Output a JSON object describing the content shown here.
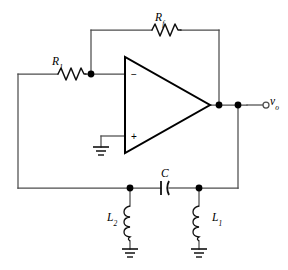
{
  "figure": {
    "name": "op-amp-colpitts-oscillator-circuit",
    "background_color": "#ffffff",
    "wire_color": "#4d4d4d",
    "component_color": "#111111",
    "node_color": "#000000"
  },
  "labels": {
    "rf": "R",
    "rf_sub": "f",
    "r1": "R",
    "r1_sub": "1",
    "c": "C",
    "l2": "L",
    "l2_sub": "2",
    "l1": "L",
    "l1_sub": "1",
    "vo": "v",
    "vo_sub": "o"
  },
  "opamp": {
    "inverting_sign": "−",
    "noninverting_sign": "+"
  },
  "components": [
    {
      "id": "rf",
      "type": "resistor",
      "label": "Rf",
      "orientation": "horizontal"
    },
    {
      "id": "r1",
      "type": "resistor",
      "label": "R1",
      "orientation": "horizontal"
    },
    {
      "id": "c",
      "type": "capacitor",
      "label": "C",
      "orientation": "horizontal"
    },
    {
      "id": "l1",
      "type": "inductor",
      "label": "L1",
      "orientation": "vertical"
    },
    {
      "id": "l2",
      "type": "inductor",
      "label": "L2",
      "orientation": "vertical"
    },
    {
      "id": "u1",
      "type": "opamp",
      "label": "",
      "orientation": "right"
    }
  ],
  "terminals": [
    {
      "id": "vo",
      "type": "open-terminal",
      "label": "vo"
    }
  ],
  "grounds": [
    {
      "id": "gnd-opamp"
    },
    {
      "id": "gnd-l2"
    },
    {
      "id": "gnd-l1"
    }
  ]
}
